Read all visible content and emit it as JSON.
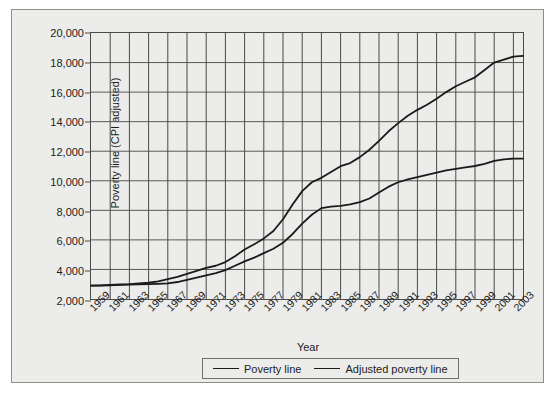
{
  "chart_data": {
    "type": "line",
    "title": "",
    "xlabel": "Year",
    "ylabel": "Poverty line (CPI adjusted)",
    "xlim": [
      1959,
      2004
    ],
    "ylim": [
      2000,
      20000
    ],
    "grid": true,
    "legend_position": "bottom",
    "y_ticks": [
      "2,000",
      "4,000",
      "6,000",
      "8,000",
      "10,000",
      "12,000",
      "14,000",
      "16,000",
      "18,000",
      "20,000"
    ],
    "y_tick_values": [
      2000,
      4000,
      6000,
      8000,
      10000,
      12000,
      14000,
      16000,
      18000,
      20000
    ],
    "x_ticks": [
      "1959",
      "1961",
      "1963",
      "1965",
      "1967",
      "1969",
      "1971",
      "1973",
      "1975",
      "1977",
      "1979",
      "1981",
      "1983",
      "1985",
      "1987",
      "1989",
      "1991",
      "1993",
      "1995",
      "1997",
      "1999",
      "2001",
      "2003"
    ],
    "x_tick_values": [
      1959,
      1961,
      1963,
      1965,
      1967,
      1969,
      1971,
      1973,
      1975,
      1977,
      1979,
      1981,
      1983,
      1985,
      1987,
      1989,
      1991,
      1993,
      1995,
      1997,
      1999,
      2001,
      2003
    ],
    "x": [
      1959,
      1960,
      1961,
      1962,
      1963,
      1964,
      1965,
      1966,
      1967,
      1968,
      1969,
      1970,
      1971,
      1972,
      1973,
      1974,
      1975,
      1976,
      1977,
      1978,
      1979,
      1980,
      1981,
      1982,
      1983,
      1984,
      1985,
      1986,
      1987,
      1988,
      1989,
      1990,
      1991,
      1992,
      1993,
      1994,
      1995,
      1996,
      1997,
      1998,
      1999,
      2000,
      2001,
      2002,
      2003,
      2004
    ],
    "series": [
      {
        "name": "Poverty line",
        "color": "#1a1a1a",
        "values": [
          2900,
          2920,
          2950,
          2980,
          3000,
          3050,
          3100,
          3200,
          3350,
          3500,
          3700,
          3900,
          4100,
          4250,
          4500,
          4900,
          5350,
          5700,
          6100,
          6600,
          7400,
          8400,
          9300,
          9900,
          10200,
          10600,
          10990,
          11200,
          11600,
          12100,
          12700,
          13350,
          13900,
          14400,
          14800,
          15150,
          15550,
          16000,
          16400,
          16700,
          17000,
          17500,
          18000,
          18200,
          18400,
          18450
        ],
        "endpoint_value": 18400
      },
      {
        "name": "Adjusted poverty line",
        "color": "#1a1a1a",
        "values": [
          2900,
          2910,
          2930,
          2950,
          2970,
          2990,
          3010,
          3030,
          3060,
          3150,
          3300,
          3450,
          3600,
          3750,
          3950,
          4250,
          4550,
          4800,
          5100,
          5400,
          5800,
          6400,
          7100,
          7700,
          8150,
          8250,
          8300,
          8400,
          8550,
          8800,
          9200,
          9600,
          9900,
          10100,
          10250,
          10400,
          10550,
          10700,
          10800,
          10900,
          11000,
          11150,
          11350,
          11450,
          11500,
          11500
        ],
        "endpoint_value": 11500
      }
    ]
  },
  "legend": {
    "entries": [
      {
        "label": "Poverty line"
      },
      {
        "label": "Adjusted poverty line"
      }
    ]
  }
}
